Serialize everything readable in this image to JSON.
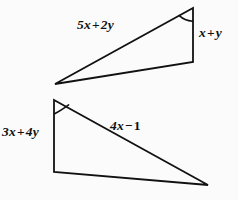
{
  "figure": {
    "background_color": "#fbfbfb",
    "stroke_color": "#111111",
    "stroke_width": 1.8,
    "triangles": [
      {
        "name": "upper-triangle",
        "vertices": [
          {
            "name": "left-vertex",
            "x": 55,
            "y": 84
          },
          {
            "name": "top-right-vertex",
            "x": 193,
            "y": 8
          },
          {
            "name": "bottom-right-vertex",
            "x": 193,
            "y": 62
          }
        ],
        "angle_marker": {
          "at_vertex": "top-right-vertex",
          "type": "single-arc"
        },
        "labels": [
          {
            "name": "hypotenuse-label",
            "text": "5x + 2y"
          },
          {
            "name": "vertical-side-label",
            "text": "x + y"
          }
        ]
      },
      {
        "name": "lower-triangle",
        "vertices": [
          {
            "name": "top-left-vertex",
            "x": 54,
            "y": 100
          },
          {
            "name": "bottom-left-vertex",
            "x": 54,
            "y": 172
          },
          {
            "name": "right-vertex",
            "x": 208,
            "y": 185
          }
        ],
        "angle_marker": {
          "at_vertex": "top-left-vertex",
          "type": "single-arc"
        },
        "labels": [
          {
            "name": "vertical-side-label",
            "text": "3x + 4y"
          },
          {
            "name": "hypotenuse-label",
            "text": "4x − 1"
          }
        ]
      }
    ]
  },
  "labels": {
    "upper_long_side": {
      "coefficient_a": "5x",
      "operator": "+",
      "coefficient_b": "2y",
      "full_text": "5x + 2y"
    },
    "upper_short_side": {
      "coefficient_a": "x",
      "operator": "+",
      "coefficient_b": "y",
      "full_text": "x + y"
    },
    "lower_short_side": {
      "coefficient_a": "3x",
      "operator": "+",
      "coefficient_b": "4y",
      "full_text": "3x + 4y"
    },
    "lower_long_side": {
      "coefficient_a": "4x",
      "operator": "−",
      "coefficient_b": "1",
      "full_text": "4x − 1"
    }
  }
}
